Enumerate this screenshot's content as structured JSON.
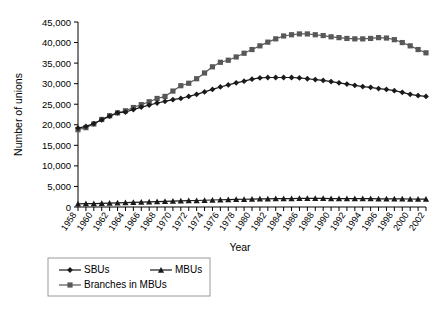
{
  "chart_data": {
    "type": "line",
    "title": "",
    "xlabel": "Year",
    "ylabel": "Number of unions",
    "xlim": [
      1958,
      2002
    ],
    "ylim": [
      0,
      45000
    ],
    "grid": false,
    "legend_position": "bottom-left",
    "ytick_labels": [
      "0",
      "5,000",
      "10,000",
      "15,000",
      "20,000",
      "25,000",
      "30,000",
      "35,000",
      "40,000",
      "45,000"
    ],
    "ytick_values": [
      0,
      5000,
      10000,
      15000,
      20000,
      25000,
      30000,
      35000,
      40000,
      45000
    ],
    "x": [
      1958,
      1959,
      1960,
      1961,
      1962,
      1963,
      1964,
      1965,
      1966,
      1967,
      1968,
      1969,
      1970,
      1971,
      1972,
      1973,
      1974,
      1975,
      1976,
      1977,
      1978,
      1979,
      1980,
      1981,
      1982,
      1983,
      1984,
      1985,
      1986,
      1987,
      1988,
      1989,
      1990,
      1991,
      1992,
      1993,
      1994,
      1995,
      1996,
      1997,
      1998,
      1999,
      2000,
      2001,
      2002
    ],
    "xtick_labels": [
      "1958",
      "1960",
      "1962",
      "1964",
      "1966",
      "1968",
      "1970",
      "1972",
      "1974",
      "1976",
      "1978",
      "1980",
      "1982",
      "1984",
      "1986",
      "1988",
      "1990",
      "1992",
      "1994",
      "1996",
      "1998",
      "2000",
      "2002"
    ],
    "series": [
      {
        "name": "SBUs",
        "marker": "diamond",
        "color": "#1a1a1a",
        "values": [
          19200,
          19600,
          20300,
          21200,
          22100,
          22900,
          23100,
          23700,
          24300,
          24800,
          25300,
          25700,
          26100,
          26400,
          26900,
          27400,
          28000,
          28600,
          29200,
          29700,
          30200,
          30600,
          31100,
          31400,
          31500,
          31500,
          31500,
          31500,
          31400,
          31200,
          31000,
          30800,
          30500,
          30200,
          29900,
          29600,
          29300,
          29100,
          28800,
          28600,
          28300,
          27900,
          27400,
          27100,
          26900
        ]
      },
      {
        "name": "MBUs",
        "marker": "triangle",
        "color": "#1a1a1a",
        "values": [
          760,
          800,
          840,
          900,
          960,
          1020,
          1080,
          1140,
          1200,
          1260,
          1320,
          1380,
          1440,
          1500,
          1540,
          1580,
          1640,
          1700,
          1760,
          1800,
          1840,
          1880,
          1920,
          1960,
          2000,
          2020,
          2040,
          2060,
          2080,
          2080,
          2080,
          2080,
          2060,
          2060,
          2040,
          2040,
          2020,
          2020,
          2000,
          2000,
          1980,
          1960,
          1940,
          1920,
          1900
        ]
      },
      {
        "name": "Branches in MBUs",
        "marker": "square",
        "color": "#585858",
        "values": [
          18800,
          19300,
          20200,
          21300,
          22200,
          22900,
          23400,
          24200,
          24900,
          25600,
          26400,
          26900,
          28200,
          29500,
          30100,
          31200,
          32600,
          34100,
          35200,
          35700,
          36500,
          37400,
          38300,
          39200,
          40100,
          40900,
          41600,
          41900,
          42100,
          42100,
          41900,
          41700,
          41400,
          41200,
          41000,
          40900,
          40900,
          41000,
          41200,
          41100,
          40700,
          40000,
          39200,
          38300,
          37500
        ]
      }
    ]
  }
}
